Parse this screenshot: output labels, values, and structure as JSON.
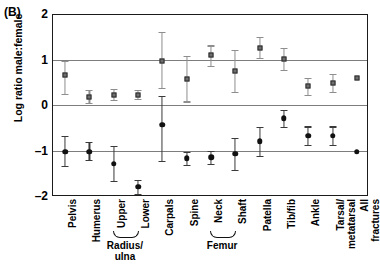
{
  "panel": {
    "label": "(B)"
  },
  "chart_data": {
    "type": "scatter",
    "title": "",
    "xlabel": "",
    "ylabel": "Log ratio male:female",
    "ylim": [
      -2,
      2
    ],
    "yticks": [
      2,
      1,
      0,
      -1,
      -2
    ],
    "ytick_labels": [
      "2",
      "1",
      "0",
      "-1",
      "-2"
    ],
    "gridlines": [
      1,
      0,
      -1
    ],
    "grid": true,
    "legend_position": "none",
    "categories": [
      "Pelvis",
      "Humerus",
      "Upper",
      "Lower",
      "Carpals",
      "Spine",
      "Neck",
      "Shaft",
      "Patella",
      "Tib/fib",
      "Ankle",
      "Tarsal/\nmetatarsal",
      "All\nfractures"
    ],
    "group_brackets": [
      {
        "label": "Radius/\nulna",
        "from": 2,
        "to": 3
      },
      {
        "label": "Femur",
        "from": 6,
        "to": 7
      }
    ],
    "series": [
      {
        "name": "upper-estimate",
        "marker": "open-square",
        "color": "#6e6e6e",
        "values": [
          0.69,
          0.2,
          0.25,
          0.25,
          1.0,
          0.6,
          1.11,
          0.76,
          1.28,
          1.03,
          0.43,
          0.5,
          0.62
        ],
        "err_low": [
          0.26,
          0.06,
          0.13,
          0.15,
          0.4,
          0.1,
          0.88,
          0.3,
          1.05,
          0.8,
          0.24,
          0.3,
          0.62
        ],
        "err_high": [
          1.0,
          0.36,
          0.37,
          0.35,
          1.62,
          1.1,
          1.33,
          1.23,
          1.52,
          1.27,
          0.62,
          0.7,
          0.62
        ]
      },
      {
        "name": "lower-estimate",
        "marker": "filled-circle",
        "color": "#111111",
        "values": [
          -1.0,
          -1.0,
          -1.27,
          -1.78,
          -0.41,
          -1.15,
          -1.13,
          -1.05,
          -0.78,
          -0.27,
          -0.65,
          -0.65,
          -1.0
        ],
        "err_low": [
          -1.31,
          -1.19,
          -1.64,
          -1.93,
          -1.2,
          -1.3,
          -1.28,
          -1.4,
          -1.09,
          -0.46,
          -0.85,
          -0.85,
          -1.0
        ],
        "err_high": [
          -0.66,
          -0.8,
          -0.88,
          -1.63,
          0.22,
          -1.0,
          -0.98,
          -0.7,
          -0.47,
          -0.09,
          -0.45,
          -0.45,
          -1.0
        ]
      }
    ]
  }
}
